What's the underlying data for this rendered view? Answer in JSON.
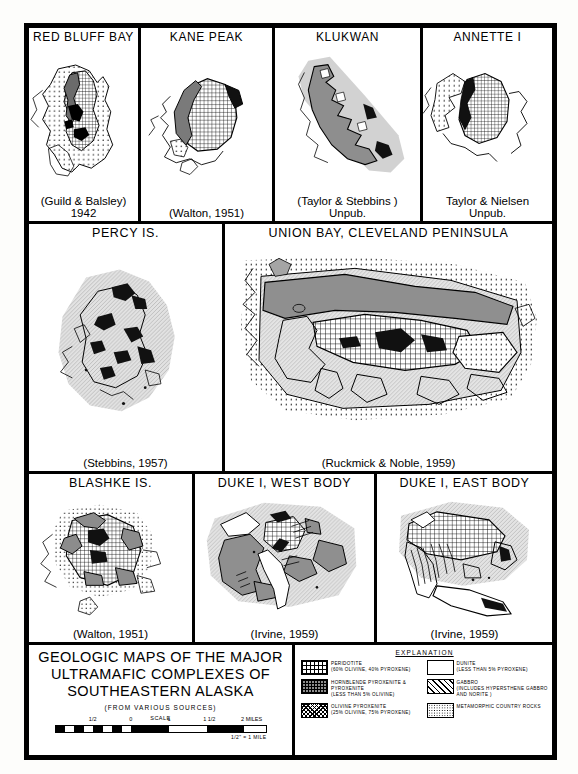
{
  "figure": {
    "rows": [
      {
        "id": "row-top",
        "panels": [
          {
            "title": "RED BLUFF BAY",
            "caption": "(Guild & Balsley)\n1942",
            "width": 112
          },
          {
            "title": "KANE PEAK",
            "caption": "(Walton, 1951)",
            "width": 134
          },
          {
            "title": "KLUKWAN",
            "caption": "(Taylor & Stebbins )\nUnpub.",
            "width": 148
          },
          {
            "title": "ANNETTE I",
            "caption": "Taylor & Nielsen\nUnpub.",
            "width": 129
          }
        ]
      },
      {
        "id": "row-mid",
        "panels": [
          {
            "title": "PERCY IS.",
            "caption": "(Stebbins, 1957)",
            "width": 196
          },
          {
            "title": "UNION BAY, CLEVELAND PENINSULA",
            "caption": "(Ruckmick & Noble, 1959)",
            "width": 327
          }
        ]
      },
      {
        "id": "row-bot",
        "panels": [
          {
            "title": "BLASHKE IS.",
            "caption": "(Walton, 1951)",
            "width": 166
          },
          {
            "title": "DUKE I, WEST BODY",
            "caption": "(Irvine, 1959)",
            "width": 182
          },
          {
            "title": "DUKE I, EAST BODY",
            "caption": "(Irvine, 1959)",
            "width": 175
          }
        ]
      }
    ]
  },
  "title_block": {
    "line1": "GEOLOGIC MAPS OF THE MAJOR",
    "line2": "ULTRAMAFIC COMPLEXES OF",
    "line3": "SOUTHEASTERN ALASKA",
    "sources": "(FROM VARIOUS SOURCES)",
    "scale_label": "SCALE",
    "scale_ticks": [
      "1/2",
      "0",
      "1",
      "1 1/2",
      "2 MILES"
    ],
    "scale_footnote": "1/2\" = 1 MILE"
  },
  "legend": {
    "heading": "EXPLANATION",
    "left_items": [
      {
        "pattern": "sw-peridotite",
        "name": "PERIDOTITE",
        "detail": "(60% OLIVINE, 40% PYROXENE)"
      },
      {
        "pattern": "sw-hornblende",
        "name": "HORNBLENDE PYROXENITE & PYROXENITE",
        "detail": "(LESS THAN 5% OLIVINE)"
      },
      {
        "pattern": "sw-olivpyx",
        "name": "OLIVINE PYROXENITE",
        "detail": "(25% OLIVINE, 75% PYROXENE)"
      }
    ],
    "right_items": [
      {
        "pattern": "sw-dunite",
        "name": "DUNITE",
        "detail": "(LESS THAN 5% PYROXENE)"
      },
      {
        "pattern": "sw-gabbro",
        "name": "GABBRO",
        "detail": "(INCLUDES HYPERSTHENE GABBRO AND NORITE )"
      },
      {
        "pattern": "sw-metamorphic",
        "name": "METAMORPHIC COUNTRY ROCKS",
        "detail": ""
      }
    ]
  }
}
